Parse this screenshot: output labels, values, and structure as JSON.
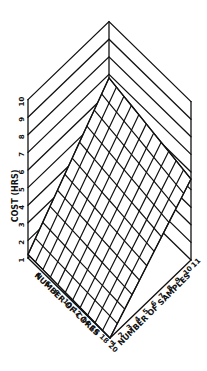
{
  "chart_data": {
    "type": "surface3d",
    "title": "",
    "zlabel": "COST (HRS)",
    "xlabel": "NUMBER OF CORES",
    "ylabel": "NUMBER OF SAMPLES",
    "z_ticks": [
      "1",
      "2",
      "3",
      "4",
      "5",
      "6",
      "7",
      "8",
      "9",
      "10"
    ],
    "x_ticks": [
      "4",
      "6",
      "8",
      "10",
      "12",
      "14",
      "16",
      "18",
      "20"
    ],
    "y_ticks": [
      "1",
      "2",
      "3",
      "4",
      "5",
      "6",
      "7",
      "8",
      "9",
      "10",
      "11"
    ],
    "zlim": [
      1,
      10
    ],
    "xlim": [
      2,
      20
    ],
    "ylim": [
      1,
      11
    ],
    "grid": true,
    "surface_description": "Planar mesh surface; cost increases with number of cores and decreases with number of samples",
    "corner_values": [
      {
        "cores": 2,
        "samples": 1,
        "cost": 1.2
      },
      {
        "cores": 20,
        "samples": 1,
        "cost": 1.0
      },
      {
        "cores": 2,
        "samples": 11,
        "cost": 6.8
      },
      {
        "cores": 20,
        "samples": 11,
        "cost": 5.6
      }
    ]
  },
  "labels": {
    "z_axis": "COST  (HRS)",
    "x_axis": "NUMBER OF CORES",
    "y_axis": "NUMBER OF SAMPLES"
  }
}
